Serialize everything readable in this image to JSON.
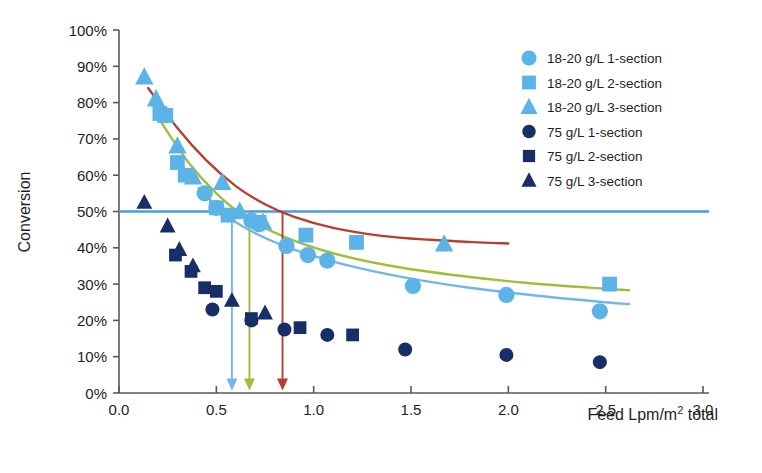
{
  "chart_data": {
    "type": "scatter",
    "title": "",
    "xlabel": "Feed Lpm/m² total",
    "ylabel": "Conversion",
    "xlim": [
      0.0,
      3.0
    ],
    "ylim": [
      0,
      1
    ],
    "grid": false,
    "legend_position": "top-right",
    "xticks": [
      "0.0",
      "0.5",
      "1.0",
      "1.5",
      "2.0",
      "2.5",
      "3.0"
    ],
    "xtick_values": [
      0.0,
      0.5,
      1.0,
      1.5,
      2.0,
      2.5,
      3.0
    ],
    "yticks": [
      "0%",
      "10%",
      "20%",
      "30%",
      "40%",
      "50%",
      "60%",
      "70%",
      "80%",
      "90%",
      "100%"
    ],
    "ytick_values": [
      0,
      10,
      20,
      30,
      40,
      50,
      60,
      70,
      80,
      90,
      100
    ],
    "series": [
      {
        "name": "18-20 g/L 1-section",
        "marker": "circle",
        "color": "#5BB3E8",
        "points": [
          {
            "x": 0.44,
            "y": 55.0
          },
          {
            "x": 0.5,
            "y": 51.0
          },
          {
            "x": 0.68,
            "y": 47.5
          },
          {
            "x": 0.72,
            "y": 46.5
          },
          {
            "x": 0.86,
            "y": 40.5
          },
          {
            "x": 0.97,
            "y": 38.0
          },
          {
            "x": 1.07,
            "y": 36.5
          },
          {
            "x": 1.51,
            "y": 29.5
          },
          {
            "x": 1.99,
            "y": 27.0
          },
          {
            "x": 2.47,
            "y": 22.5
          }
        ]
      },
      {
        "name": "18-20 g/L 2-section",
        "marker": "square",
        "color": "#5BB3E8",
        "points": [
          {
            "x": 0.21,
            "y": 77.0
          },
          {
            "x": 0.24,
            "y": 76.5
          },
          {
            "x": 0.3,
            "y": 63.5
          },
          {
            "x": 0.34,
            "y": 60.0
          },
          {
            "x": 0.5,
            "y": 51.0
          },
          {
            "x": 0.56,
            "y": 49.0
          },
          {
            "x": 0.72,
            "y": 47.0
          },
          {
            "x": 0.96,
            "y": 43.5
          },
          {
            "x": 1.22,
            "y": 41.5
          },
          {
            "x": 2.52,
            "y": 30.0
          }
        ]
      },
      {
        "name": "18-20 g/L 3-section",
        "marker": "triangle",
        "color": "#5BB3E8",
        "points": [
          {
            "x": 0.13,
            "y": 87.0
          },
          {
            "x": 0.19,
            "y": 81.0
          },
          {
            "x": 0.24,
            "y": 76.5
          },
          {
            "x": 0.3,
            "y": 68.0
          },
          {
            "x": 0.38,
            "y": 59.5
          },
          {
            "x": 0.53,
            "y": 58.0
          },
          {
            "x": 0.62,
            "y": 50.0
          },
          {
            "x": 0.74,
            "y": 47.0
          },
          {
            "x": 1.67,
            "y": 41.0
          }
        ]
      },
      {
        "name": "75 g/L 1-section",
        "marker": "circle",
        "color": "#182E66",
        "points": [
          {
            "x": 0.48,
            "y": 23.0
          },
          {
            "x": 0.68,
            "y": 20.0
          },
          {
            "x": 0.85,
            "y": 17.5
          },
          {
            "x": 1.07,
            "y": 16.0
          },
          {
            "x": 1.47,
            "y": 12.0
          },
          {
            "x": 1.99,
            "y": 10.5
          },
          {
            "x": 2.47,
            "y": 8.5
          }
        ]
      },
      {
        "name": "75 g/L 2-section",
        "marker": "square",
        "color": "#182E66",
        "points": [
          {
            "x": 0.29,
            "y": 38.0
          },
          {
            "x": 0.37,
            "y": 33.5
          },
          {
            "x": 0.44,
            "y": 29.0
          },
          {
            "x": 0.5,
            "y": 28.0
          },
          {
            "x": 0.68,
            "y": 20.5
          },
          {
            "x": 0.93,
            "y": 18.0
          },
          {
            "x": 1.2,
            "y": 16.0
          }
        ]
      },
      {
        "name": "75 g/L 3-section",
        "marker": "triangle",
        "color": "#182E66",
        "points": [
          {
            "x": 0.13,
            "y": 52.5
          },
          {
            "x": 0.25,
            "y": 46.0
          },
          {
            "x": 0.31,
            "y": 39.5
          },
          {
            "x": 0.38,
            "y": 35.0
          },
          {
            "x": 0.58,
            "y": 25.5
          },
          {
            "x": 0.75,
            "y": 22.0
          }
        ]
      }
    ],
    "trend_lines": [
      {
        "name": "red-trend-3-section",
        "color": "#B5402E",
        "points": [
          {
            "x": 0.15,
            "y": 84.0
          },
          {
            "x": 0.3,
            "y": 73.0
          },
          {
            "x": 0.45,
            "y": 64.0
          },
          {
            "x": 0.6,
            "y": 57.0
          },
          {
            "x": 0.75,
            "y": 52.0
          },
          {
            "x": 0.9,
            "y": 48.5
          },
          {
            "x": 1.1,
            "y": 45.5
          },
          {
            "x": 1.35,
            "y": 43.3
          },
          {
            "x": 1.6,
            "y": 42.2
          },
          {
            "x": 1.85,
            "y": 41.5
          },
          {
            "x": 2.0,
            "y": 41.2
          }
        ]
      },
      {
        "name": "green-trend-2-section",
        "color": "#9DBF3A",
        "points": [
          {
            "x": 0.2,
            "y": 76.0
          },
          {
            "x": 0.35,
            "y": 64.0
          },
          {
            "x": 0.5,
            "y": 55.0
          },
          {
            "x": 0.65,
            "y": 48.5
          },
          {
            "x": 0.85,
            "y": 43.0
          },
          {
            "x": 1.1,
            "y": 38.5
          },
          {
            "x": 1.4,
            "y": 35.0
          },
          {
            "x": 1.75,
            "y": 32.3
          },
          {
            "x": 2.1,
            "y": 30.3
          },
          {
            "x": 2.5,
            "y": 28.7
          },
          {
            "x": 2.62,
            "y": 28.3
          }
        ]
      },
      {
        "name": "blue-trend-1-section",
        "color": "#6FB7E8",
        "points": [
          {
            "x": 0.41,
            "y": 56.5
          },
          {
            "x": 0.55,
            "y": 49.0
          },
          {
            "x": 0.7,
            "y": 44.0
          },
          {
            "x": 0.9,
            "y": 39.5
          },
          {
            "x": 1.15,
            "y": 35.5
          },
          {
            "x": 1.45,
            "y": 32.0
          },
          {
            "x": 1.8,
            "y": 29.0
          },
          {
            "x": 2.15,
            "y": 26.8
          },
          {
            "x": 2.5,
            "y": 25.0
          },
          {
            "x": 2.62,
            "y": 24.5
          }
        ]
      }
    ],
    "reference_line": {
      "name": "50-percent-target",
      "color": "#4A9BE0",
      "y": 50.0
    },
    "arrows": [
      {
        "name": "blue-arrow",
        "x": 0.58,
        "color": "#6FB7E8",
        "from_y": 50.0,
        "to_y": 1.5
      },
      {
        "name": "green-arrow",
        "x": 0.67,
        "color": "#9DBF3A",
        "from_y": 50.0,
        "to_y": 1.5
      },
      {
        "name": "red-arrow",
        "x": 0.84,
        "color": "#B5402E",
        "from_y": 50.0,
        "to_y": 1.5
      }
    ],
    "legend": [
      {
        "label": "18-20 g/L 1-section",
        "marker": "circle",
        "color": "#5BB3E8"
      },
      {
        "label": "18-20 g/L 2-section",
        "marker": "square",
        "color": "#5BB3E8"
      },
      {
        "label": "18-20 g/L 3-section",
        "marker": "triangle",
        "color": "#5BB3E8"
      },
      {
        "label": "75 g/L 1-section",
        "marker": "circle",
        "color": "#182E66"
      },
      {
        "label": "75 g/L 2-section",
        "marker": "square",
        "color": "#182E66"
      },
      {
        "label": "75 g/L 3-section",
        "marker": "triangle",
        "color": "#182E66"
      }
    ]
  },
  "axes": {
    "x_title": "Feed Lpm/m² total",
    "y_title": "Conversion"
  }
}
